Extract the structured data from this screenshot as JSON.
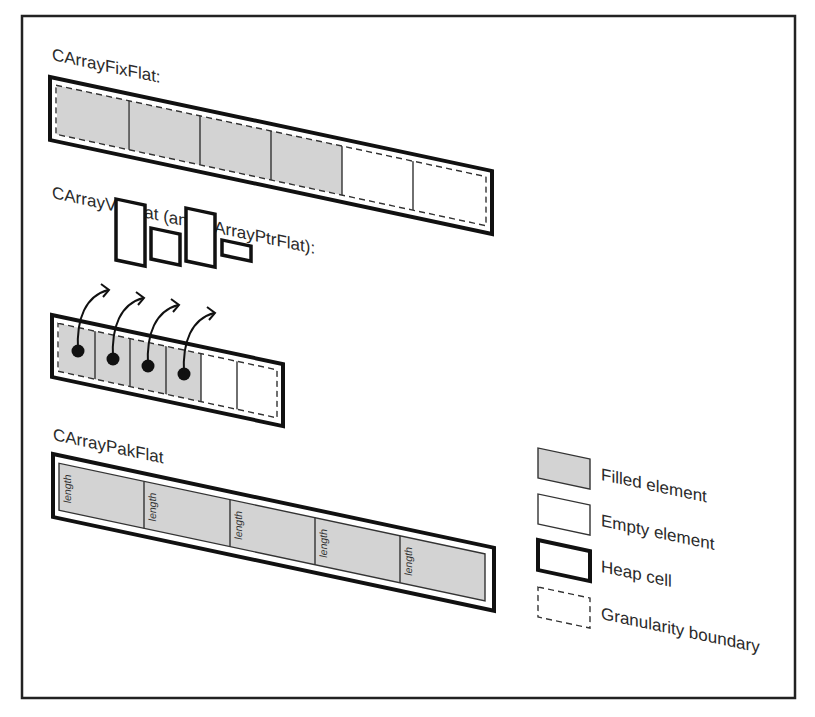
{
  "diagram": {
    "sections": [
      {
        "id": "fixflat",
        "title": "CArrayFixFlat:",
        "elements": [
          "filled",
          "filled",
          "filled",
          "filled",
          "empty",
          "empty"
        ]
      },
      {
        "id": "varflat",
        "title": "CArrayVarFlat (and CArrayPtrFlat):",
        "elements": [
          "filled",
          "filled",
          "filled",
          "filled",
          "empty",
          "empty"
        ],
        "pointed_objects": 4
      },
      {
        "id": "pakflat",
        "title": "CArrayPakFlat",
        "segment_label": "length",
        "segments": [
          "length",
          "length",
          "length",
          "length",
          "length"
        ]
      }
    ],
    "legend": [
      {
        "key": "filled",
        "label": "Filled element"
      },
      {
        "key": "empty",
        "label": "Empty element"
      },
      {
        "key": "heap",
        "label": "Heap cell"
      },
      {
        "key": "granularity",
        "label": "Granularity boundary"
      }
    ],
    "colors": {
      "filled": "#d3d3d3",
      "stroke": "#111111",
      "background": "#ffffff"
    }
  }
}
